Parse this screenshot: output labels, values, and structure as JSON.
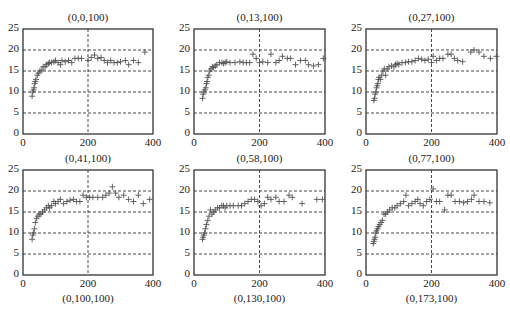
{
  "layout": {
    "panels": [
      {
        "left": 23,
        "top": 29,
        "width": 130,
        "height": 105
      },
      {
        "left": 194,
        "top": 29,
        "width": 131,
        "height": 105
      },
      {
        "left": 366,
        "top": 29,
        "width": 131,
        "height": 105
      },
      {
        "left": 23,
        "top": 170,
        "width": 130,
        "height": 105
      },
      {
        "left": 194,
        "top": 170,
        "width": 131,
        "height": 105
      },
      {
        "left": 366,
        "top": 170,
        "width": 131,
        "height": 105
      }
    ]
  },
  "chart_data": [
    {
      "type": "scatter",
      "title": "(0,0,100)",
      "bottom_label": "",
      "xlim": [
        0,
        400
      ],
      "ylim": [
        0,
        25
      ],
      "xticks": [
        0,
        200,
        400
      ],
      "yticks": [
        0,
        5,
        10,
        15,
        20,
        25
      ],
      "grid": {
        "horizontal": [
          5,
          10,
          15,
          20
        ],
        "vertical": [
          200
        ],
        "style": "dashed"
      },
      "marker": "+",
      "points": [
        [
          28,
          9
        ],
        [
          30,
          10
        ],
        [
          32,
          10.5
        ],
        [
          34,
          11
        ],
        [
          36,
          12
        ],
        [
          38,
          12.5
        ],
        [
          40,
          13
        ],
        [
          44,
          14
        ],
        [
          48,
          14.5
        ],
        [
          52,
          15
        ],
        [
          58,
          15.2
        ],
        [
          62,
          16
        ],
        [
          68,
          16
        ],
        [
          72,
          16.5
        ],
        [
          78,
          16.8
        ],
        [
          82,
          17
        ],
        [
          88,
          17
        ],
        [
          95,
          17.2
        ],
        [
          100,
          17.5
        ],
        [
          108,
          17
        ],
        [
          115,
          16.5
        ],
        [
          120,
          17.5
        ],
        [
          130,
          17.2
        ],
        [
          140,
          17.5
        ],
        [
          150,
          17
        ],
        [
          160,
          18
        ],
        [
          170,
          18
        ],
        [
          180,
          18
        ],
        [
          200,
          17.5
        ],
        [
          210,
          18.2
        ],
        [
          220,
          18.8
        ],
        [
          230,
          18
        ],
        [
          240,
          18.2
        ],
        [
          250,
          17.5
        ],
        [
          260,
          17
        ],
        [
          270,
          17.5
        ],
        [
          280,
          17
        ],
        [
          290,
          17
        ],
        [
          300,
          17.2
        ],
        [
          315,
          17.5
        ],
        [
          325,
          16.5
        ],
        [
          340,
          17.5
        ],
        [
          355,
          17
        ],
        [
          375,
          19.5
        ]
      ]
    },
    {
      "type": "scatter",
      "title": "(0,13,100)",
      "bottom_label": "",
      "xlim": [
        0,
        400
      ],
      "ylim": [
        0,
        25
      ],
      "xticks": [
        0,
        200,
        400
      ],
      "yticks": [
        0,
        5,
        10,
        15,
        20,
        25
      ],
      "grid": {
        "horizontal": [
          5,
          10,
          15,
          20
        ],
        "vertical": [
          200
        ],
        "style": "dashed"
      },
      "marker": "+",
      "points": [
        [
          26,
          8.5
        ],
        [
          28,
          9.5
        ],
        [
          30,
          10
        ],
        [
          33,
          10.5
        ],
        [
          36,
          11
        ],
        [
          38,
          12
        ],
        [
          40,
          12.5
        ],
        [
          42,
          13.5
        ],
        [
          45,
          14
        ],
        [
          48,
          15
        ],
        [
          52,
          15.5
        ],
        [
          56,
          16
        ],
        [
          60,
          15.8
        ],
        [
          65,
          16.2
        ],
        [
          70,
          16.5
        ],
        [
          78,
          17
        ],
        [
          85,
          17
        ],
        [
          90,
          16.8
        ],
        [
          95,
          17
        ],
        [
          100,
          17.2
        ],
        [
          110,
          17
        ],
        [
          125,
          17
        ],
        [
          140,
          17.2
        ],
        [
          150,
          17
        ],
        [
          160,
          17
        ],
        [
          170,
          17
        ],
        [
          180,
          19
        ],
        [
          190,
          18
        ],
        [
          200,
          17
        ],
        [
          210,
          17.2
        ],
        [
          225,
          17
        ],
        [
          235,
          19
        ],
        [
          250,
          17
        ],
        [
          260,
          17.5
        ],
        [
          270,
          18.5
        ],
        [
          285,
          18
        ],
        [
          295,
          18
        ],
        [
          310,
          16.5
        ],
        [
          325,
          17.5
        ],
        [
          340,
          17.5
        ],
        [
          350,
          16.5
        ],
        [
          365,
          16.2
        ],
        [
          380,
          16.5
        ],
        [
          395,
          18
        ]
      ]
    },
    {
      "type": "scatter",
      "title": "(0,27,100)",
      "bottom_label": "",
      "xlim": [
        0,
        400
      ],
      "ylim": [
        0,
        25
      ],
      "xticks": [
        0,
        200,
        400
      ],
      "yticks": [
        0,
        5,
        10,
        15,
        20,
        25
      ],
      "grid": {
        "horizontal": [
          5,
          10,
          15,
          20
        ],
        "vertical": [
          200
        ],
        "style": "dashed"
      },
      "marker": "+",
      "points": [
        [
          24,
          8
        ],
        [
          26,
          8.5
        ],
        [
          28,
          9.5
        ],
        [
          30,
          10
        ],
        [
          32,
          11
        ],
        [
          34,
          11.5
        ],
        [
          36,
          12
        ],
        [
          38,
          13
        ],
        [
          40,
          13.5
        ],
        [
          44,
          13
        ],
        [
          48,
          14
        ],
        [
          52,
          15
        ],
        [
          56,
          15.5
        ],
        [
          60,
          14
        ],
        [
          65,
          15.5
        ],
        [
          70,
          16
        ],
        [
          78,
          16.2
        ],
        [
          85,
          16
        ],
        [
          90,
          16.5
        ],
        [
          95,
          16.8
        ],
        [
          100,
          16.5
        ],
        [
          110,
          17
        ],
        [
          120,
          17
        ],
        [
          130,
          17.2
        ],
        [
          140,
          17.2
        ],
        [
          150,
          17.5
        ],
        [
          160,
          18
        ],
        [
          170,
          17.8
        ],
        [
          180,
          17.5
        ],
        [
          190,
          17.8
        ],
        [
          200,
          17
        ],
        [
          205,
          18.5
        ],
        [
          215,
          17.5
        ],
        [
          225,
          18
        ],
        [
          235,
          18
        ],
        [
          250,
          19
        ],
        [
          260,
          19
        ],
        [
          270,
          18
        ],
        [
          280,
          17.5
        ],
        [
          295,
          17.2
        ],
        [
          320,
          19.5
        ],
        [
          330,
          20
        ],
        [
          345,
          19.5
        ],
        [
          360,
          18.5
        ],
        [
          380,
          18
        ],
        [
          398,
          18.5
        ]
      ]
    },
    {
      "type": "scatter",
      "title": "(0,41,100)",
      "bottom_label": "(0,100,100)",
      "xlim": [
        0,
        400
      ],
      "ylim": [
        0,
        25
      ],
      "xticks": [
        0,
        200,
        400
      ],
      "yticks": [
        0,
        5,
        10,
        15,
        20,
        25
      ],
      "grid": {
        "horizontal": [
          5,
          10,
          15,
          20
        ],
        "vertical": [
          200
        ],
        "style": "dashed"
      },
      "marker": "+",
      "points": [
        [
          28,
          8.5
        ],
        [
          30,
          9.5
        ],
        [
          32,
          10
        ],
        [
          35,
          11
        ],
        [
          38,
          12.5
        ],
        [
          42,
          13.5
        ],
        [
          46,
          14
        ],
        [
          50,
          14.5
        ],
        [
          55,
          14.5
        ],
        [
          60,
          15
        ],
        [
          66,
          15.5
        ],
        [
          72,
          16
        ],
        [
          78,
          16.5
        ],
        [
          82,
          16
        ],
        [
          88,
          16.5
        ],
        [
          95,
          17.5
        ],
        [
          100,
          17
        ],
        [
          108,
          17.5
        ],
        [
          115,
          18
        ],
        [
          125,
          17
        ],
        [
          135,
          17.5
        ],
        [
          145,
          17.8
        ],
        [
          155,
          18
        ],
        [
          165,
          17.5
        ],
        [
          175,
          17.5
        ],
        [
          185,
          19
        ],
        [
          195,
          18.5
        ],
        [
          205,
          18.5
        ],
        [
          215,
          18.5
        ],
        [
          230,
          18.5
        ],
        [
          245,
          18.5
        ],
        [
          255,
          19
        ],
        [
          265,
          19.5
        ],
        [
          275,
          21
        ],
        [
          285,
          19.5
        ],
        [
          295,
          18.5
        ],
        [
          310,
          19
        ],
        [
          325,
          18
        ],
        [
          340,
          17.5
        ],
        [
          355,
          19
        ],
        [
          370,
          17
        ],
        [
          390,
          18
        ]
      ]
    },
    {
      "type": "scatter",
      "title": "(0,58,100)",
      "bottom_label": "(0,130,100)",
      "xlim": [
        0,
        400
      ],
      "ylim": [
        0,
        25
      ],
      "xticks": [
        0,
        200,
        400
      ],
      "yticks": [
        0,
        5,
        10,
        15,
        20,
        25
      ],
      "grid": {
        "horizontal": [
          5,
          10,
          15,
          20
        ],
        "vertical": [
          200
        ],
        "style": "dashed"
      },
      "marker": "+",
      "points": [
        [
          26,
          8.5
        ],
        [
          28,
          9
        ],
        [
          30,
          9.5
        ],
        [
          32,
          10
        ],
        [
          35,
          11
        ],
        [
          38,
          12
        ],
        [
          42,
          13
        ],
        [
          46,
          14
        ],
        [
          50,
          15.5
        ],
        [
          55,
          14.5
        ],
        [
          60,
          15
        ],
        [
          65,
          15.5
        ],
        [
          72,
          16
        ],
        [
          78,
          16
        ],
        [
          85,
          16.5
        ],
        [
          90,
          16.5
        ],
        [
          95,
          16
        ],
        [
          100,
          16.5
        ],
        [
          110,
          16.5
        ],
        [
          120,
          16.5
        ],
        [
          135,
          16.5
        ],
        [
          145,
          16.5
        ],
        [
          155,
          17
        ],
        [
          165,
          17.5
        ],
        [
          175,
          18
        ],
        [
          185,
          18
        ],
        [
          195,
          17.5
        ],
        [
          205,
          16.5
        ],
        [
          215,
          17
        ],
        [
          225,
          18.5
        ],
        [
          235,
          18
        ],
        [
          250,
          18.5
        ],
        [
          260,
          17.5
        ],
        [
          275,
          17.5
        ],
        [
          290,
          19
        ],
        [
          300,
          18.5
        ],
        [
          330,
          17
        ],
        [
          375,
          18
        ],
        [
          392,
          18
        ]
      ]
    },
    {
      "type": "scatter",
      "title": "(0,77,100)",
      "bottom_label": "(0,173,100)",
      "xlim": [
        0,
        400
      ],
      "ylim": [
        0,
        25
      ],
      "xticks": [
        0,
        200,
        400
      ],
      "yticks": [
        0,
        5,
        10,
        15,
        20,
        25
      ],
      "grid": {
        "horizontal": [
          5,
          10,
          15,
          20
        ],
        "vertical": [
          200
        ],
        "style": "dashed"
      },
      "marker": "+",
      "points": [
        [
          22,
          7.5
        ],
        [
          24,
          8
        ],
        [
          26,
          8.5
        ],
        [
          28,
          9
        ],
        [
          30,
          10
        ],
        [
          32,
          10.5
        ],
        [
          35,
          11
        ],
        [
          38,
          11.5
        ],
        [
          42,
          12
        ],
        [
          46,
          12.5
        ],
        [
          50,
          13
        ],
        [
          55,
          14.5
        ],
        [
          60,
          14.5
        ],
        [
          66,
          15
        ],
        [
          72,
          15.5
        ],
        [
          80,
          16
        ],
        [
          88,
          16
        ],
        [
          95,
          16.5
        ],
        [
          105,
          17
        ],
        [
          115,
          17.5
        ],
        [
          122,
          19
        ],
        [
          130,
          16.5
        ],
        [
          140,
          17
        ],
        [
          150,
          17.5
        ],
        [
          158,
          18
        ],
        [
          165,
          17
        ],
        [
          175,
          16.5
        ],
        [
          185,
          17.5
        ],
        [
          195,
          18
        ],
        [
          205,
          20.5
        ],
        [
          215,
          17.5
        ],
        [
          225,
          17.5
        ],
        [
          240,
          15.5
        ],
        [
          250,
          19
        ],
        [
          260,
          19
        ],
        [
          272,
          17.5
        ],
        [
          285,
          17.5
        ],
        [
          298,
          17.2
        ],
        [
          310,
          17.5
        ],
        [
          322,
          18
        ],
        [
          330,
          19
        ],
        [
          345,
          17.5
        ],
        [
          360,
          17.5
        ],
        [
          378,
          17.2
        ]
      ]
    }
  ]
}
